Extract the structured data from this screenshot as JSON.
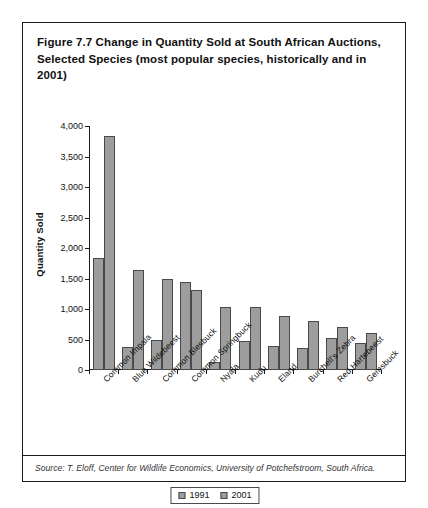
{
  "figure": {
    "title": "Figure 7.7  Change in Quantity Sold at South African Auctions, Selected Species (most popular species, historically and in 2001)",
    "source": "Source: T. Eloff, Center for Wildlife Economics, University of Potchefstroom, South Africa.",
    "bar_fill_color": "#9d9d9d",
    "bar_edge_color": "#4a4a4a",
    "frame_color": "#1a1a1a"
  },
  "chart_data": {
    "type": "bar",
    "title": "Figure 7.7  Change in Quantity Sold at South African Auctions, Selected Species (most popular species, historically and in 2001)",
    "xlabel": "",
    "ylabel": "Quantity Sold",
    "ylim": [
      0,
      4000
    ],
    "yticks": [
      0,
      500,
      1000,
      1500,
      2000,
      2500,
      3000,
      3500,
      4000
    ],
    "ytick_labels": [
      "0",
      "500",
      "1,000",
      "1,500",
      "2,000",
      "2,500",
      "3,000",
      "3,500",
      "4,000"
    ],
    "grid": false,
    "legend_position": "bottom-center",
    "categories": [
      "Common Impala",
      "Blue Wildebeest",
      "Common Blesbuck",
      "Common Springbuck",
      "Nyala",
      "Kudu",
      "Eland",
      "Burchell's Zebra",
      "Red Hartebeest",
      "Gemsbuck"
    ],
    "series": [
      {
        "name": "1991",
        "values": [
          1830,
          370,
          500,
          1440,
          130,
          470,
          390,
          360,
          530,
          450
        ]
      },
      {
        "name": "2001",
        "values": [
          3840,
          1640,
          1490,
          1310,
          1030,
          1030,
          890,
          810,
          700,
          600
        ]
      }
    ]
  }
}
